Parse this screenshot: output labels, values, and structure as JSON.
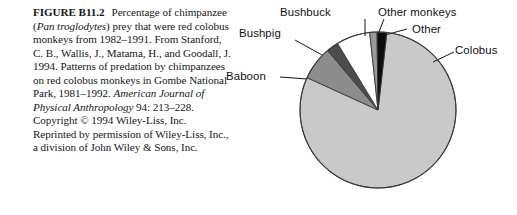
{
  "figure": {
    "number_label": "FIGURE B11.2",
    "caption_parts": [
      {
        "text": "FIGURE B11.2",
        "style": "bold"
      },
      {
        "text": "Percentage of chimpanzee (",
        "style": "normal"
      },
      {
        "text": "Pan troglodytes",
        "style": "italic"
      },
      {
        "text": ") prey that were red colobus monkeys from 1982–1991. From Stanford, C. B., Wallis, J., Matama, H., and Goodall, J. 1994. Patterns of predation by chimpanzees on red colobus monkeys in Gombe National Park, 1981–1992. ",
        "style": "normal"
      },
      {
        "text": "American Journal of Physical Anthropology",
        "style": "italic"
      },
      {
        "text": " 94: 213–228. Copyright © 1994 Wiley-Liss, Inc. Reprinted by permission of Wiley-Liss, Inc., a division of John Wiley & Sons, Inc.",
        "style": "normal"
      }
    ],
    "caption_plain": "FIGURE B11.2  Percentage of chimpanzee (Pan troglodytes) prey that were red colobus monkeys from 1982–1991. From Stanford, C. B., Wallis, J., Matama, H., and Goodall, J. 1994. Patterns of predation by chimpanzees on red colobus monkeys in Gombe National Park, 1981–1992. American Journal of Physical Anthropology 94: 213–228. Copyright © 1994 Wiley-Liss, Inc. Reprinted by permission of Wiley-Liss, Inc., a division of John Wiley & Sons, Inc.",
    "caption_segments": {
      "fignum": "FIGURE B11.2",
      "s1": "Percentage of chimpanzee (",
      "i1": "Pan troglodytes",
      "s2": ") prey that were red colobus monkeys from 1982–1991. From Stanford, C. B., Wallis, J., Matama, H., and Goodall, J. 1994. Patterns of predation by chimpanzees on red colobus monkeys in Gombe National Park, 1981–1992. ",
      "i2": "American Journal of Physical Anthropology",
      "s3": " 94: 213–228. Copyright © 1994 Wiley-Liss, Inc. Reprinted by permission of Wiley-Liss, Inc., a division of John Wiley & Sons, Inc."
    }
  },
  "chart_data": {
    "type": "pie",
    "title": "",
    "legend_position": "callout-labels",
    "labels": [
      "Colobus",
      "Bushbuck",
      "Other monkeys",
      "Other",
      "Bushpig",
      "Baboon"
    ],
    "values": [
      80.0,
      7.0,
      1.5,
      2.0,
      7.0,
      2.5
    ],
    "units": "percent",
    "slices": [
      {
        "name": "Colobus",
        "label": "Colobus",
        "value": 80.0,
        "color": "#c9c9c9",
        "start_angle": 6.5,
        "end_angle": 294.5
      },
      {
        "name": "Bushpig",
        "label": "Bushpig",
        "value": 7.0,
        "color": "#8c8c8c",
        "start_angle": 294.5,
        "end_angle": 319.7
      },
      {
        "name": "Baboon",
        "label": "Baboon",
        "value": 2.5,
        "color": "#4c4c4c",
        "start_angle": 319.7,
        "end_angle": 328.7
      },
      {
        "name": "Bushbuck",
        "label": "Bushbuck",
        "value": 7.0,
        "color": "#ffffff",
        "start_angle": 328.7,
        "end_angle": 353.9
      },
      {
        "name": "Other monkeys",
        "label": "Other monkeys",
        "value": 1.5,
        "color": "#9a9a9a",
        "start_angle": 353.9,
        "end_angle": 359.3
      },
      {
        "name": "Other",
        "label": "Other",
        "value": 2.0,
        "color": "#0d0d0d",
        "start_angle": 359.3,
        "end_angle": 366.5
      }
    ],
    "geometry": {
      "cx": 126,
      "cy": 110,
      "r": 78
    },
    "outline_color": "#3a3a3a"
  },
  "colors": {
    "colobus": "#c9c9c9",
    "bushpig": "#8c8c8c",
    "baboon": "#4c4c4c",
    "bushbuck": "#ffffff",
    "other_monkeys": "#9a9a9a",
    "other": "#0d0d0d",
    "text": "#15161a",
    "background": "#ffffff"
  }
}
